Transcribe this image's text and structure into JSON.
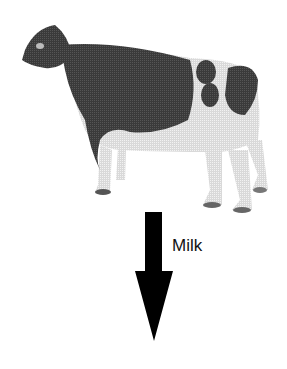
{
  "figure": {
    "arrow": {
      "direction": "down",
      "label": "Milk",
      "color": "#000000"
    },
    "colors": {
      "cow_dark": "#3a3a3a",
      "cow_light": "#e6e6e6",
      "background": "#ffffff"
    }
  }
}
